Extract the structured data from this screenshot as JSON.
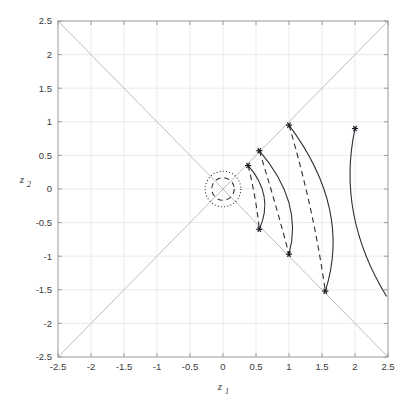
{
  "chart_data": {
    "type": "line",
    "title": "",
    "xlabel": "z_1",
    "ylabel": "z_2",
    "xlim": [
      -2.5,
      2.5
    ],
    "ylim": [
      -2.5,
      2.5
    ],
    "grid": true,
    "legend": "none",
    "xticks": [
      -2.5,
      -2,
      -1.5,
      -1,
      -0.5,
      0,
      0.5,
      1,
      1.5,
      2,
      2.5
    ],
    "xticklabels": [
      "-2.5",
      "-2",
      "-1.5",
      "-1",
      "-0.5",
      "0",
      "0.5",
      "1",
      "1.5",
      "2",
      "2.5"
    ],
    "yticks": [
      -2.5,
      -2,
      -1.5,
      -1,
      -0.5,
      0,
      0.5,
      1,
      1.5,
      2,
      2.5
    ],
    "yticklabels": [
      "-2.5",
      "-2",
      "-1.5",
      "-1",
      "-0.5",
      "0",
      "0.5",
      "1",
      "1.5",
      "2",
      "2.5"
    ],
    "colors": {
      "curve": "#2f2f37",
      "grid": "#e6e6e6",
      "diagonal": "#b5b5b5",
      "axis": "#9a9a9a",
      "marker": "#1f1f27",
      "text": "#3a3a3a"
    },
    "reference_lines": [
      {
        "name": "diagonal-positive",
        "from": [
          -2.5,
          -2.5
        ],
        "to": [
          2.5,
          2.5
        ],
        "style": "solid",
        "color": "#b5b5b5"
      },
      {
        "name": "diagonal-negative",
        "from": [
          -2.5,
          2.5
        ],
        "to": [
          2.5,
          -2.5
        ],
        "style": "solid",
        "color": "#b5b5b5"
      }
    ],
    "circles": [
      {
        "name": "inner-circle",
        "center": [
          0,
          0
        ],
        "radius": 0.17,
        "style": "dashed"
      },
      {
        "name": "outer-circle",
        "center": [
          0,
          0
        ],
        "radius": 0.27,
        "style": "dotted"
      }
    ],
    "series": [
      {
        "name": "arc-solid-1",
        "style": "solid",
        "start": [
          0.38,
          0.35
        ],
        "end": [
          0.55,
          -0.6
        ],
        "control": [
          0.78,
          -0.1
        ],
        "markers": [
          [
            0.38,
            0.35
          ],
          [
            0.55,
            -0.6
          ]
        ]
      },
      {
        "name": "arc-dashed-1",
        "style": "dashed",
        "start": [
          0.38,
          0.35
        ],
        "end": [
          0.55,
          -0.6
        ],
        "control": [
          0.5,
          -0.12
        ],
        "markers": []
      },
      {
        "name": "arc-solid-2",
        "style": "solid",
        "start": [
          0.55,
          0.57
        ],
        "end": [
          1.0,
          -0.97
        ],
        "control": [
          1.22,
          -0.2
        ],
        "markers": [
          [
            0.55,
            0.57
          ],
          [
            1.0,
            -0.97
          ]
        ]
      },
      {
        "name": "arc-dashed-2",
        "style": "dashed",
        "start": [
          0.55,
          0.57
        ],
        "end": [
          1.0,
          -0.97
        ],
        "control": [
          0.8,
          -0.22
        ],
        "markers": []
      },
      {
        "name": "arc-solid-3",
        "style": "solid",
        "start": [
          1.0,
          0.95
        ],
        "end": [
          1.55,
          -1.52
        ],
        "control": [
          1.95,
          -0.3
        ],
        "markers": [
          [
            1.0,
            0.95
          ],
          [
            1.55,
            -1.52
          ]
        ]
      },
      {
        "name": "arc-dashed-3",
        "style": "dashed",
        "start": [
          1.0,
          0.95
        ],
        "end": [
          1.55,
          -1.52
        ],
        "control": [
          1.38,
          -0.32
        ],
        "markers": []
      },
      {
        "name": "arc-solid-4",
        "style": "solid",
        "start": [
          2.0,
          0.9
        ],
        "end": [
          2.48,
          -1.6
        ],
        "control": [
          1.72,
          -0.38
        ],
        "markers": [
          [
            2.0,
            0.9
          ]
        ]
      }
    ]
  }
}
